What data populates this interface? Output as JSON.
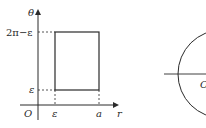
{
  "left_diagram": {
    "vertical_axis_label": "θ",
    "horizontal_axis_label": "r",
    "origin_label": "O",
    "y_top_label": "2π−ε",
    "y_bottom_label": "ε",
    "x_left_label": "ε",
    "x_right_label": "a"
  },
  "right_diagram": {
    "center_label": "O"
  },
  "colors": {
    "stroke": "#2a2a2a",
    "background": "#ffffff"
  }
}
